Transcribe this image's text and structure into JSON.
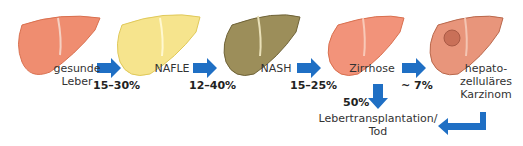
{
  "stages": [
    {
      "label": "gesunde\nLeber",
      "line1": "gesunde",
      "line2": "Leber",
      "color": "#ef8d70"
    },
    {
      "label": "NAFLE",
      "color": "#f6e48d"
    },
    {
      "label": "NASH",
      "color": "#9c8e5a"
    },
    {
      "label": "Zirrhose",
      "color": "#f2937a"
    },
    {
      "label": "hepato-zelluläres Karzinom",
      "line1": "hepato-",
      "line2": "zelluläres",
      "line3": "Karzinom",
      "color": "#e8957b"
    }
  ],
  "transitions": [
    {
      "from": "gesunde Leber",
      "to": "NAFLE",
      "rate": "15–30%"
    },
    {
      "from": "NAFLE",
      "to": "NASH",
      "rate": "12–40%"
    },
    {
      "from": "NASH",
      "to": "Zirrhose",
      "rate": "15–25%"
    },
    {
      "from": "Zirrhose",
      "to": "hepatozelluläres Karzinom",
      "rate": "~ 7%"
    },
    {
      "from": "Zirrhose",
      "to": "Lebertransplantation/Tod",
      "rate": "50%"
    }
  ],
  "outcome": {
    "line1": "Lebertransplantation/",
    "line2": "Tod"
  },
  "arrow_color": "#1f6fc4"
}
